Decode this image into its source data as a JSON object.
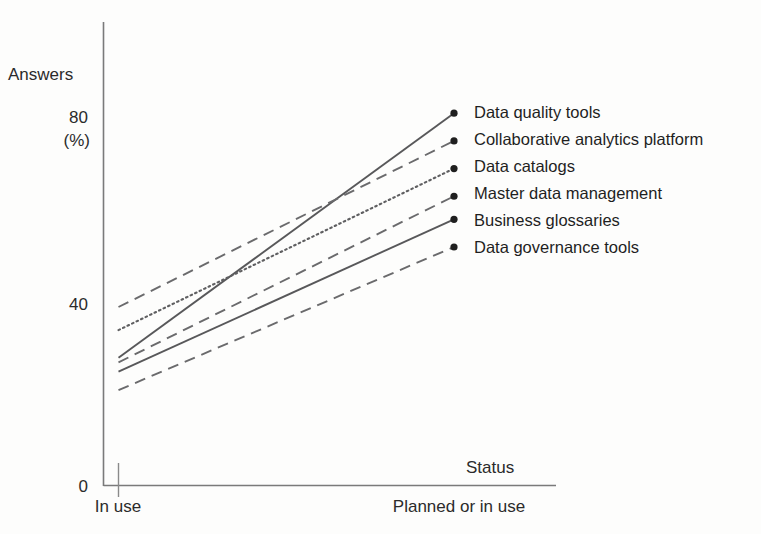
{
  "chart_data": {
    "type": "line",
    "title": "",
    "xlabel": "Status",
    "ylabel": "Answers (%)",
    "categories": [
      "In use",
      "Planned or in use"
    ],
    "ytick_labels": [
      "0",
      "40",
      "80"
    ],
    "ytick_values": [
      0,
      40,
      80
    ],
    "ylim": [
      0,
      90
    ],
    "grid": false,
    "legend_position": "right",
    "series": [
      {
        "name": "Data quality tools",
        "values": [
          28,
          81
        ],
        "line_style": "solid",
        "color": "#58585a",
        "marker": "dot"
      },
      {
        "name": "Collaborative analytics platform",
        "values": [
          39,
          75
        ],
        "line_style": "dashed",
        "color": "#6a6a6c",
        "marker": "dot"
      },
      {
        "name": "Data catalogs",
        "values": [
          34,
          69
        ],
        "line_style": "dotted",
        "color": "#5f5f61",
        "marker": "dot"
      },
      {
        "name": "Master data management",
        "values": [
          27,
          63
        ],
        "line_style": "dashed",
        "color": "#6a6a6c",
        "marker": "dot"
      },
      {
        "name": "Business glossaries",
        "values": [
          25,
          58
        ],
        "line_style": "solid",
        "color": "#58585a",
        "marker": "dot"
      },
      {
        "name": "Data governance tools",
        "values": [
          21,
          52
        ],
        "line_style": "dashed",
        "color": "#6a6a6c",
        "marker": "dot"
      }
    ]
  },
  "axes": {
    "y_label_line1": "Answers",
    "y_label_line2": "(%)",
    "x_title": "Status",
    "y_ticks": [
      "80",
      "40",
      "0"
    ],
    "x_categories": [
      "In use",
      "Planned or in use"
    ]
  },
  "legend": {
    "items": [
      "Data quality tools",
      "Collaborative analytics platform",
      "Data catalogs",
      "Master data management",
      "Business glossaries",
      "Data governance tools"
    ]
  }
}
